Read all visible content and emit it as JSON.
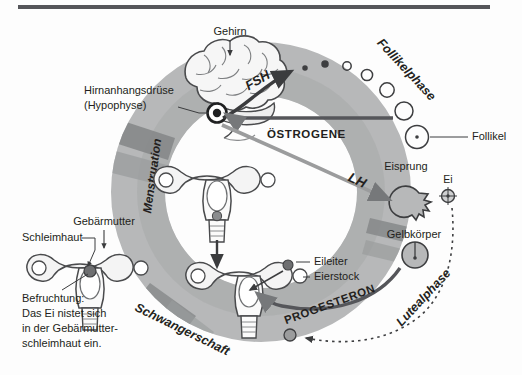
{
  "figure": {
    "language": "de",
    "background_color": "#fdfdfd",
    "top_bar_color": "#55565a"
  },
  "palette": {
    "ring_light": "#b7b8b9",
    "ring_mid": "#9b9c9d",
    "ring_dark": "#7f8183",
    "outline": "#3d3e40",
    "arrow_dark": "#3b3c3e",
    "arrow_mid": "#76787a",
    "text": "#231f20",
    "organ_fill": "#f3f3f3",
    "organ_shade": "#cfd0d1",
    "egg_fill": "#6e6f71"
  },
  "labels": {
    "brain": "Gehirn",
    "pituitary_line1": "Hirnanhangsdrüse",
    "pituitary_line2": "(Hypophyse)",
    "fsh": "FSH",
    "lh": "LH",
    "estrogen": "ÖSTROGENE",
    "progesterone": "PROGESTERON",
    "follicular_phase": "Follikelphase",
    "luteal_phase": "Lutealphase",
    "menstruation": "Menstruation",
    "pregnancy": "Schwangerschaft",
    "follicle": "Follikel",
    "ovulation": "Eisprung",
    "egg": "Ei",
    "corpus_luteum": "Gelbkörper",
    "fallopian_tube": "Eileiter",
    "ovary": "Eierstock",
    "uterus": "Gebärmutter",
    "endometrium": "Schleimhaut",
    "fertilization_line1": "Befruchtung:",
    "fertilization_line2": "Das Ei nistet sich",
    "fertilization_line3": "in der Gebärmutter-",
    "fertilization_line4": "schleimhaut ein."
  },
  "follicle_series": {
    "description": "Wachsende Follikel entlang der Follikelphase",
    "count": 7,
    "radii": [
      2.0,
      3.0,
      4.2,
      5.6,
      7.2,
      9.0,
      11.5
    ]
  }
}
